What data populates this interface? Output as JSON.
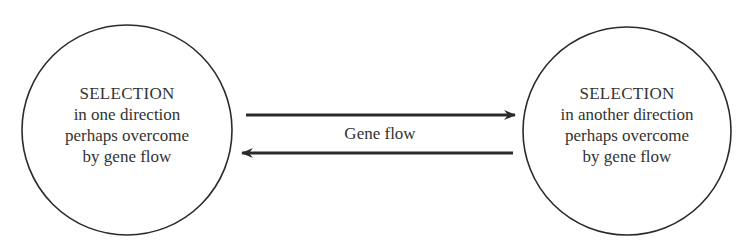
{
  "diagram": {
    "nodes": [
      {
        "id": "left",
        "title": "SELECTION",
        "lines": [
          "in one direction",
          "perhaps overcome",
          "by gene flow"
        ],
        "shape": "circle",
        "center": [
          127,
          130
        ],
        "radius": 105
      },
      {
        "id": "right",
        "title": "SELECTION",
        "lines": [
          "in another direction",
          "perhaps overcome",
          "by gene flow"
        ],
        "shape": "circle",
        "center": [
          627,
          131
        ],
        "radius": 104
      }
    ],
    "edges": [
      {
        "from": "left",
        "to": "right",
        "direction": "rightward",
        "y": 115
      },
      {
        "from": "right",
        "to": "left",
        "direction": "leftward",
        "y": 153
      }
    ],
    "edge_label": "Gene flow",
    "colors": {
      "stroke": "#2b2b2b",
      "text": "#333333",
      "background": "#ffffff"
    }
  }
}
